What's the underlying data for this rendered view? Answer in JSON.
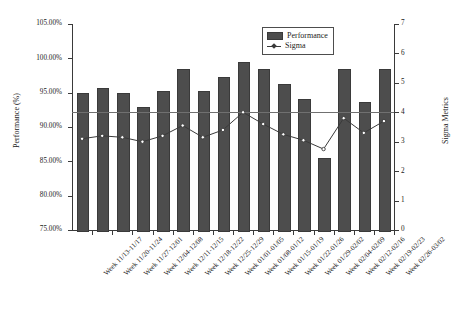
{
  "chart_data": {
    "type": "bar",
    "title": "",
    "xlabel": "",
    "ylabel": "Performance (%)",
    "y2label": "Sigma Metrics",
    "ylim": [
      75,
      105
    ],
    "y2lim": [
      0,
      7
    ],
    "grid": false,
    "legend_position": "top-right",
    "categories": [
      "Week 11/13-11/17",
      "Week 11/20-11/24",
      "Week 11/27-12/01",
      "Week 12/04-12/08",
      "Week 12/11-12/15",
      "Week 12/18-12/22",
      "Week 12/25-12/29",
      "Week 01/01-01/05",
      "Week 01/08-01/12",
      "Week 01/15-01/19",
      "Week 01/22-01/26",
      "Week 01/29-02/02",
      "Week 02/04-02/09",
      "Week 02/12-02/16",
      "Week 02/19-02/23",
      "Week 02/26-03/02"
    ],
    "series": [
      {
        "name": "Performance",
        "axis": "left",
        "type": "bar",
        "color": "#4d4d4d",
        "values": [
          95.0,
          95.7,
          95.0,
          92.9,
          95.3,
          98.4,
          95.3,
          97.3,
          99.5,
          98.4,
          96.2,
          94.1,
          85.5,
          98.4,
          93.6,
          98.4
        ]
      },
      {
        "name": "Sigma",
        "axis": "right",
        "type": "line",
        "color": "#3a3a3a",
        "values": [
          3.1,
          3.2,
          3.15,
          3.0,
          3.2,
          3.55,
          3.15,
          3.4,
          4.0,
          3.6,
          3.25,
          3.05,
          2.75,
          3.8,
          3.3,
          3.7
        ]
      }
    ],
    "reference_line": {
      "label": "",
      "y2_value": 4.0,
      "color": "#707070"
    },
    "y_ticks": [
      "75.00%",
      "80.00%",
      "85.00%",
      "90.00%",
      "95.00%",
      "100.00%",
      "105.00%"
    ],
    "y2_ticks": [
      "0",
      "1",
      "2",
      "3",
      "4",
      "5",
      "6",
      "7"
    ],
    "legend": [
      {
        "label": "Performance",
        "marker": "bar-swatch"
      },
      {
        "label": "Sigma",
        "marker": "line-marker"
      }
    ]
  }
}
